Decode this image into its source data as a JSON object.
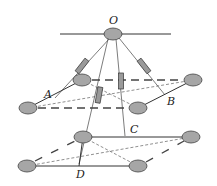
{
  "diagram": {
    "colors": {
      "line": "#333333",
      "node_fill": "#a6a6a6",
      "node_stroke": "#444444",
      "spring_fill": "#9a9a9a"
    },
    "labels": {
      "O": "O",
      "A": "A",
      "B": "B",
      "C": "C",
      "D": "D"
    },
    "nodes": {
      "O": [
        113,
        34
      ],
      "upper_back_left": [
        82,
        80
      ],
      "upper_back_right": [
        193,
        80
      ],
      "upper_front_left": [
        28,
        108
      ],
      "upper_front_right": [
        138,
        108
      ],
      "lower_back_left": [
        83,
        137
      ],
      "lower_back_right": [
        191,
        137
      ],
      "lower_front_left": [
        27,
        166
      ],
      "lower_front_right": [
        138,
        166
      ]
    }
  }
}
